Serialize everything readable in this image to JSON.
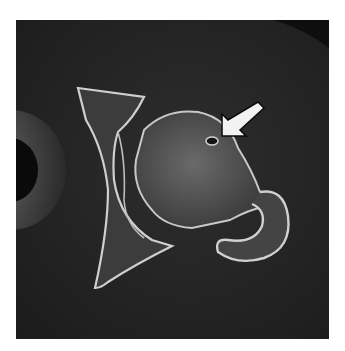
{
  "image": {
    "kind": "axial CT scan of hip joint",
    "background": "#ffffff",
    "panel_bg": "#222222",
    "annotation": {
      "type": "arrow",
      "color": "#f2f2f2",
      "direction": "down-left",
      "points_to": "lesion in femoral head"
    }
  }
}
